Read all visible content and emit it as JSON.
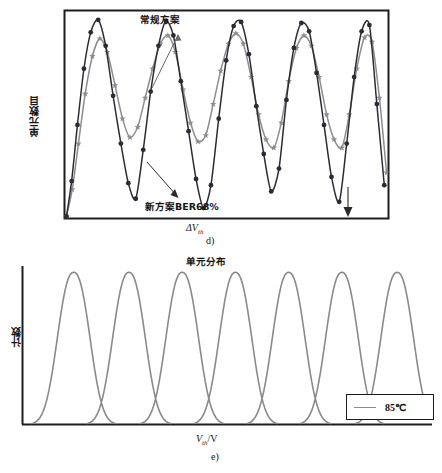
{
  "figure_d": {
    "caption": "d)",
    "y_axis_label": "单元数目",
    "x_axis_label_main": "ΔV",
    "x_axis_label_sub": "th",
    "annotations": {
      "conventional": "常规方案",
      "new_scheme": "新方案BER68%"
    },
    "colors": {
      "series_dark": "#2b2b38",
      "series_gray": "#8d8d8d",
      "frame": "#1d1d1d",
      "annotation_arrow": "#555555"
    },
    "chart_data": {
      "type": "line",
      "title": "",
      "xlabel": "ΔVth",
      "ylabel": "单元数目",
      "grid": false,
      "legend_position": "none",
      "xlim": [
        0,
        100
      ],
      "ylim": [
        0,
        100
      ],
      "series": [
        {
          "name": "新方案BER68%",
          "color": "#2b2b38",
          "marker": "circle",
          "x": [
            0.6,
            2.2,
            4.0,
            6.0,
            8.1,
            10.4,
            12.7,
            15.0,
            17.4,
            19.7,
            22.0,
            24.3,
            26.6,
            29.0,
            31.3,
            33.6,
            35.9,
            38.3,
            40.6,
            42.9,
            45.2,
            47.6,
            49.9,
            52.2,
            54.5,
            56.9,
            59.2,
            61.5,
            63.8,
            66.2,
            68.5,
            70.8,
            73.1,
            75.5,
            77.8,
            80.1,
            82.4,
            84.8,
            87.1,
            89.4,
            91.7,
            94.1,
            96.4,
            98.7
          ],
          "y": [
            1.0,
            18.0,
            45.0,
            72.0,
            89.5,
            95.5,
            83.0,
            59.0,
            36.0,
            17.0,
            9.5,
            33.0,
            61.0,
            83.0,
            95.0,
            88.0,
            66.0,
            42.0,
            19.0,
            5.0,
            16.0,
            48.0,
            76.0,
            92.5,
            94.5,
            79.0,
            54.0,
            31.0,
            13.0,
            24.0,
            57.0,
            82.0,
            94.0,
            90.0,
            70.0,
            45.0,
            20.0,
            8.0,
            36.0,
            68.0,
            90.0,
            93.0,
            55.0,
            16.0
          ]
        },
        {
          "name": "常规方案",
          "color": "#8d8d8d",
          "marker": "star",
          "x": [
            0.6,
            2.4,
            4.3,
            6.4,
            8.6,
            10.9,
            13.2,
            15.6,
            17.9,
            20.2,
            22.6,
            24.9,
            27.2,
            29.6,
            31.9,
            34.2,
            36.6,
            38.9,
            41.2,
            43.6,
            45.9,
            48.2,
            50.6,
            52.9,
            55.2,
            57.6,
            59.9,
            62.2,
            64.6,
            66.9,
            69.2,
            71.6,
            73.9,
            76.2,
            78.6,
            80.9,
            83.2,
            85.6,
            87.9,
            90.2,
            92.6,
            94.9,
            97.2,
            99.4
          ],
          "y": [
            1.0,
            14.0,
            36.0,
            60.0,
            78.0,
            86.5,
            80.0,
            64.0,
            48.0,
            39.0,
            44.0,
            58.0,
            72.0,
            84.0,
            88.0,
            80.0,
            62.0,
            46.0,
            37.0,
            40.0,
            55.0,
            71.0,
            84.0,
            89.0,
            84.0,
            68.0,
            50.0,
            38.0,
            34.0,
            46.0,
            66.0,
            82.0,
            88.0,
            83.0,
            68.0,
            50.0,
            38.0,
            34.0,
            50.0,
            72.0,
            87.0,
            85.0,
            58.0,
            22.0
          ]
        }
      ]
    }
  },
  "figure_e": {
    "caption": "e)",
    "title": "单元分布",
    "y_axis_label": "计数",
    "x_axis_label_main": "V",
    "x_axis_label_sub": "th",
    "x_axis_label_unit": "/V",
    "legend": {
      "label": "85℃",
      "swatch_color": "#8a8a8a"
    },
    "colors": {
      "curve": "#8a8a8a",
      "axis": "#1d1d1d",
      "legend_border": "#1a1a1a"
    },
    "chart_data": {
      "type": "line",
      "title": "单元分布",
      "xlabel": "Vth/V",
      "ylabel": "计数",
      "grid": false,
      "legend_position": "bottom-right",
      "legend_entries": [
        "85℃"
      ],
      "xlim": [
        0,
        100
      ],
      "ylim": [
        0,
        100
      ],
      "peak_count": 7,
      "series": [
        {
          "name": "85℃",
          "color": "#8a8a8a",
          "peak_centers": [
            12.5,
            26.0,
            39.0,
            52.0,
            65.0,
            78.0,
            91.5
          ],
          "peak_height": 96,
          "peak_half_width": 5.6,
          "baseline": 0
        }
      ]
    }
  }
}
